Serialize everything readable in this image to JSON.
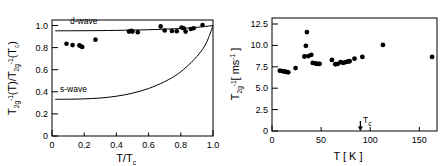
{
  "figure": {
    "panels": [
      "left",
      "right"
    ],
    "marker_color": "#000000",
    "axis_color": "#000000",
    "background": "#ffffff"
  },
  "left_panel": {
    "xlabel_main": "T/T",
    "xlabel_sub": "c",
    "ylabel_parts": {
      "t1": "T",
      "t1_sub": "2g",
      "t1_sup": "-1",
      "t1_arg": "(T)/",
      "t2": "T",
      "t2_sub": "2g",
      "t2_sup": "-1",
      "t2_arg": "(T",
      "t2_arg_sub": "c",
      "t2_close": ")"
    },
    "x_ticks": [
      "0",
      "0.2",
      "0.4",
      "0.6",
      "0.8",
      "1.0"
    ],
    "y_ticks": [
      "0",
      "0.2",
      "0.4",
      "0.6",
      "0.8",
      "1.0"
    ],
    "dwave_label": "d-wave",
    "swave_label": "s-wave"
  },
  "right_panel": {
    "xlabel": "T  [ K ]",
    "ylabel_parts": {
      "t": "T",
      "t_sub": "2g",
      "t_sup": "-1",
      "unit_open": "[ ms",
      "unit_sup": "-1",
      "unit_close": " ]"
    },
    "x_ticks": [
      "0",
      "50",
      "100",
      "150"
    ],
    "y_ticks": [
      "0",
      "2.5",
      "5.0",
      "7.5",
      "10.0",
      "12.5"
    ],
    "tc_label": "T",
    "tc_label_sub": "c"
  },
  "chart_data": [
    {
      "type": "scatter",
      "panel": "left",
      "title": "",
      "xlabel": "T/Tc",
      "ylabel": "T2g^-1(T)/T2g^-1(Tc)",
      "xlim": [
        0,
        1.0
      ],
      "ylim": [
        0,
        1.05
      ],
      "grid": false,
      "legend": [
        "d-wave",
        "s-wave"
      ],
      "legend_position": "inline-annotations",
      "series": [
        {
          "name": "data",
          "marker": "filled-circle",
          "x": [
            0.09,
            0.128,
            0.17,
            0.18,
            0.188,
            0.27,
            0.478,
            0.492,
            0.5,
            0.533,
            0.675,
            0.7,
            0.745,
            0.775,
            0.805,
            0.818,
            0.83,
            0.862,
            0.88,
            0.935
          ],
          "y": [
            0.835,
            0.823,
            0.82,
            0.812,
            0.806,
            0.872,
            0.945,
            0.952,
            0.945,
            0.94,
            0.992,
            0.955,
            0.95,
            0.948,
            0.982,
            0.975,
            0.945,
            0.968,
            0.975,
            1.005
          ]
        },
        {
          "name": "d-wave",
          "type": "line",
          "x": [
            0.02,
            0.2,
            0.4,
            0.6,
            0.75,
            0.85,
            0.93,
            1.0
          ],
          "y": [
            0.952,
            0.953,
            0.956,
            0.962,
            0.97,
            0.978,
            0.988,
            1.0
          ]
        },
        {
          "name": "s-wave",
          "type": "line",
          "x": [
            0.02,
            0.1,
            0.2,
            0.3,
            0.4,
            0.5,
            0.6,
            0.7,
            0.78,
            0.85,
            0.9,
            0.94,
            0.97,
            1.0
          ],
          "y": [
            0.332,
            0.333,
            0.336,
            0.344,
            0.36,
            0.388,
            0.43,
            0.492,
            0.56,
            0.645,
            0.72,
            0.795,
            0.88,
            1.0
          ]
        }
      ]
    },
    {
      "type": "scatter",
      "panel": "right",
      "title": "",
      "xlabel": "T [K]",
      "ylabel": "T2g^-1 [ms^-1]",
      "xlim": [
        0,
        168
      ],
      "ylim": [
        0,
        13.2
      ],
      "grid": false,
      "annotations": [
        {
          "label": "Tc",
          "x": 90,
          "y": 0,
          "type": "down-arrow"
        }
      ],
      "series": [
        {
          "name": "data",
          "marker": "filled-circle",
          "x": [
            8.0,
            10.5,
            12.5,
            14.5,
            16.5,
            24.0,
            33.0,
            34.5,
            35.5,
            37.0,
            40.0,
            41.5,
            44.0,
            45.5,
            47.0,
            48.5,
            61.0,
            64.5,
            67.0,
            70.0,
            72.5,
            75.0,
            77.0,
            79.0,
            84.0,
            92.0,
            113.0,
            163.0
          ],
          "y": [
            7.05,
            7.0,
            6.95,
            6.9,
            6.85,
            7.35,
            8.7,
            9.95,
            11.55,
            8.75,
            8.9,
            7.95,
            7.9,
            7.85,
            7.85,
            7.85,
            8.3,
            7.8,
            7.85,
            8.05,
            7.95,
            8.05,
            8.1,
            8.15,
            8.45,
            8.65,
            10.05,
            8.65
          ]
        }
      ]
    }
  ]
}
